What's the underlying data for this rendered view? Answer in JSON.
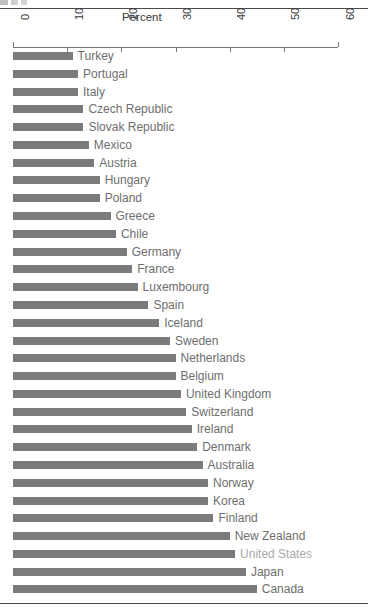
{
  "chart_data": {
    "type": "bar",
    "orientation": "horizontal",
    "title": "",
    "xlabel": "Percent",
    "ylabel": "",
    "xlim": [
      0,
      60
    ],
    "xticks": [
      0,
      10,
      20,
      30,
      40,
      50,
      60
    ],
    "xtick_labels": [
      "0",
      "10",
      "20",
      "30",
      "40",
      "50",
      "60"
    ],
    "grid": false,
    "legend": null,
    "bar_color": "#7b7b7b",
    "label_color": "#6e6e6e",
    "highlight_label_color": "#a9a9a9",
    "categories": [
      "Turkey",
      "Portugal",
      "Italy",
      "Czech Republic",
      "Slovak Republic",
      "Mexico",
      "Austria",
      "Hungary",
      "Poland",
      "Greece",
      "Chile",
      "Germany",
      "France",
      "Luxembourg",
      "Spain",
      "Iceland",
      "Sweden",
      "Netherlands",
      "Belgium",
      "United Kingdom",
      "Switzerland",
      "Ireland",
      "Denmark",
      "Australia",
      "Norway",
      "Korea",
      "Finland",
      "New Zealand",
      "United States",
      "Japan",
      "Canada"
    ],
    "values": [
      11,
      12,
      12,
      13,
      13,
      14,
      15,
      16,
      16,
      18,
      19,
      21,
      22,
      23,
      25,
      27,
      29,
      30,
      30,
      31,
      32,
      33,
      34,
      35,
      36,
      36,
      37,
      40,
      41,
      43,
      45
    ],
    "highlighted_categories": [
      "United States"
    ]
  },
  "axis": {
    "title": "Percent",
    "ticks": [
      {
        "label": "0",
        "value": 0
      },
      {
        "label": "10",
        "value": 10
      },
      {
        "label": "20",
        "value": 20
      },
      {
        "label": "30",
        "value": 30
      },
      {
        "label": "40",
        "value": 40
      },
      {
        "label": "50",
        "value": 50
      },
      {
        "label": "60",
        "value": 60
      }
    ]
  }
}
